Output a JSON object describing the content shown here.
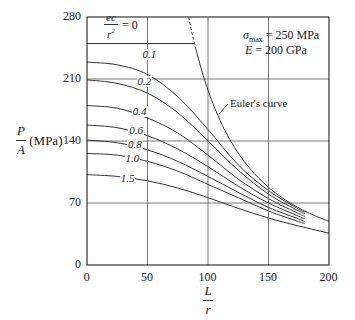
{
  "chart_data": {
    "type": "line",
    "title": "",
    "xlabel": "L/r",
    "ylabel": "P/A (MPa)",
    "xlim": [
      0,
      200
    ],
    "ylim": [
      0,
      280
    ],
    "xticks": [
      0,
      50,
      100,
      150,
      200
    ],
    "yticks": [
      0,
      70,
      140,
      210,
      280
    ],
    "grid": true,
    "annotations": {
      "top_label": "ec/r² = 0",
      "params_line1": "σmax = 250 MPa",
      "params_line2": "E = 200 GPa",
      "euler_label": "Euler's curve"
    },
    "sigma_max": 250,
    "E_GPa": 200,
    "series": [
      {
        "name": "ec/r² = 0",
        "x": [
          0,
          89
        ],
        "values": [
          250,
          250
        ]
      },
      {
        "name": "0.1",
        "x": [
          0,
          25,
          50,
          75,
          100,
          125,
          150,
          175,
          180
        ],
        "values": [
          229,
          226,
          215,
          190,
          153,
          113,
          84,
          63,
          60
        ]
      },
      {
        "name": "0.2",
        "x": [
          0,
          25,
          50,
          75,
          100,
          125,
          150,
          175,
          180
        ],
        "values": [
          209,
          205,
          194,
          172,
          140,
          107,
          80,
          61,
          58
        ]
      },
      {
        "name": "0.4",
        "x": [
          0,
          25,
          50,
          75,
          100,
          125,
          150,
          175,
          180
        ],
        "values": [
          180,
          177,
          166,
          149,
          124,
          97,
          75,
          58,
          55
        ]
      },
      {
        "name": "0.6",
        "x": [
          0,
          25,
          50,
          75,
          100,
          125,
          150,
          175,
          180
        ],
        "values": [
          158,
          155,
          146,
          131,
          111,
          89,
          70,
          55,
          52
        ]
      },
      {
        "name": "0.8",
        "x": [
          0,
          25,
          50,
          75,
          100,
          125,
          150,
          175,
          180
        ],
        "values": [
          141,
          138,
          130,
          117,
          100,
          82,
          65,
          52,
          49
        ]
      },
      {
        "name": "1.0",
        "x": [
          0,
          25,
          50,
          75,
          100,
          125,
          150,
          175,
          180
        ],
        "values": [
          126,
          124,
          117,
          106,
          91,
          76,
          61,
          49,
          47
        ]
      },
      {
        "name": "1.5",
        "x": [
          0,
          25,
          50,
          75,
          100,
          125,
          150,
          175,
          200
        ],
        "values": [
          102,
          100,
          95,
          87,
          76,
          64,
          53,
          44,
          36
        ]
      },
      {
        "name": "Euler's curve",
        "x": [
          89,
          100,
          110,
          125,
          150,
          175,
          200
        ],
        "values": [
          250,
          197,
          163,
          126,
          88,
          64,
          49
        ]
      }
    ]
  }
}
